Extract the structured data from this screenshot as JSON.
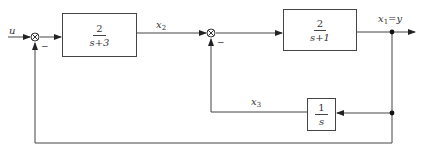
{
  "diagram": {
    "type": "block-diagram",
    "input_label": "u",
    "blocks": [
      {
        "id": "G1",
        "numerator": "2",
        "denominator": "s+3"
      },
      {
        "id": "G2",
        "numerator": "2",
        "denominator": "s+1"
      },
      {
        "id": "H",
        "numerator": "1",
        "denominator": "s"
      }
    ],
    "signals": {
      "x2": {
        "var": "x",
        "sub": "2"
      },
      "x1": {
        "var": "x",
        "sub": "1",
        "suffix": "=y"
      },
      "x3": {
        "var": "x",
        "sub": "3"
      }
    },
    "junctions": [
      {
        "id": "sum1",
        "symbol": "⊗",
        "feedback_sign": "−"
      },
      {
        "id": "sum2",
        "symbol": "⊗",
        "feedback_sign": "−"
      }
    ],
    "colors": {
      "line": "#444444",
      "background": "#ffffff"
    }
  }
}
